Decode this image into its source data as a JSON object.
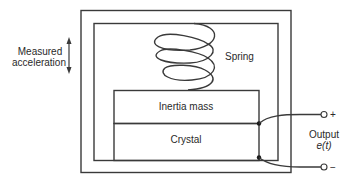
{
  "diagram": {
    "type": "piezoelectric-accelerometer",
    "labels": {
      "measured_line1": "Measured",
      "measured_line2": "acceleration",
      "spring": "Spring",
      "inertia_mass": "Inertia mass",
      "crystal": "Crystal",
      "output_line1": "Output",
      "output_line2": "e(t)",
      "plus": "+",
      "minus": "−"
    },
    "colors": {
      "stroke": "#3a3a3a",
      "text": "#2a2a2a",
      "background": "#ffffff"
    }
  }
}
